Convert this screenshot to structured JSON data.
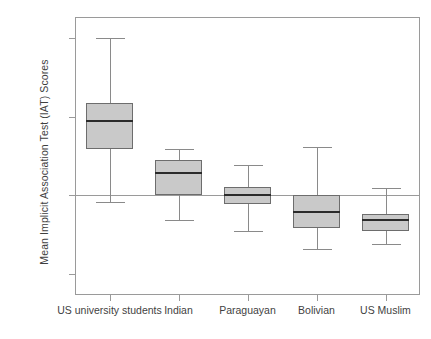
{
  "chart_data": {
    "type": "box",
    "title": "",
    "xlabel": "",
    "ylabel": "Mean Implicit Association Test (IAT) Scores",
    "categories": [
      "US university students",
      "Indian",
      "Paraguayan",
      "Bolivian",
      "US Muslim"
    ],
    "ytick_labels": [
      "2.0000",
      "1.0000",
      ".0000",
      "-1.0000"
    ],
    "ytick_values": [
      2.0,
      1.0,
      0.0,
      -1.0
    ],
    "ylim": [
      -1.27,
      2.27
    ],
    "grid": false,
    "legend": null,
    "reference_line": 0.0,
    "boxes": [
      {
        "category": "US university students",
        "whisker_high": 2.0,
        "q3": 1.18,
        "median": 0.95,
        "q1": 0.59,
        "whisker_low": -0.09
      },
      {
        "category": "Indian",
        "whisker_high": 0.59,
        "q3": 0.45,
        "median": 0.28,
        "q1": 0.0,
        "whisker_low": -0.31
      },
      {
        "category": "Paraguayan",
        "whisker_high": 0.38,
        "q3": 0.11,
        "median": 0.0,
        "q1": -0.11,
        "whisker_low": -0.46
      },
      {
        "category": "Bolivian",
        "whisker_high": 0.62,
        "q3": 0.0,
        "median": -0.21,
        "q1": -0.42,
        "whisker_low": -0.69
      },
      {
        "category": "US Muslim",
        "whisker_high": 0.09,
        "q3": -0.24,
        "median": -0.32,
        "q1": -0.46,
        "whisker_low": -0.62
      }
    ]
  },
  "colors": {
    "box_fill": "#c9c9c9",
    "box_border": "#6d6d6d",
    "median": "#2b2b2b",
    "whisker": "#8a8a8a",
    "axis": "#9a9a9a",
    "text": "#3f3f3f",
    "background": "#ffffff"
  }
}
